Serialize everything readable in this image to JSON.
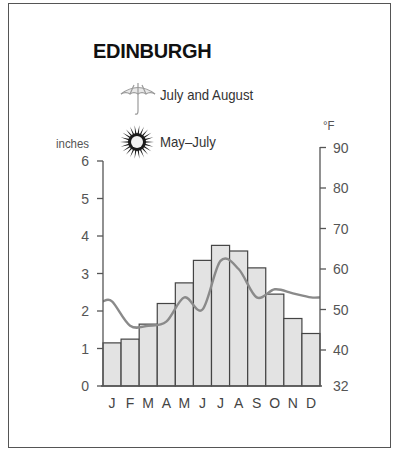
{
  "title": "EDINBURGH",
  "legend": {
    "rain": {
      "icon": "umbrella-icon",
      "label": "July and August"
    },
    "sun": {
      "icon": "sun-icon",
      "label": "May–July"
    }
  },
  "axes": {
    "left_label": "inches",
    "right_label": "°F",
    "left_ticks": [
      "0",
      "1",
      "2",
      "3",
      "4",
      "5",
      "6"
    ],
    "right_ticks": [
      "32",
      "40",
      "50",
      "60",
      "70",
      "80",
      "90"
    ]
  },
  "colors": {
    "bar_fill": "#e3e3e3",
    "bar_stroke": "#444444",
    "temp_line": "#8a8a8a",
    "axis": "#555555"
  },
  "chart_data": {
    "type": "bar",
    "title": "EDINBURGH",
    "categories": [
      "J",
      "F",
      "M",
      "A",
      "M",
      "J",
      "J",
      "A",
      "S",
      "O",
      "N",
      "D"
    ],
    "series": [
      {
        "name": "Rainfall (inches)",
        "type": "bar",
        "axis": "left",
        "values": [
          1.15,
          1.25,
          1.65,
          2.2,
          2.75,
          3.35,
          3.75,
          3.6,
          3.15,
          2.45,
          1.8,
          1.4
        ]
      },
      {
        "name": "Temperature (°F)",
        "type": "line",
        "axis": "right",
        "values": [
          52,
          46,
          46,
          47,
          53,
          50,
          62,
          60,
          53,
          55,
          54,
          53
        ]
      }
    ],
    "xlabel": "",
    "ylabel": "inches",
    "ylabel_right": "°F",
    "ylim": [
      0,
      6
    ],
    "ylim_right": [
      32,
      90
    ],
    "legend_entries": [
      "July and August (wettest)",
      "May–July (sunniest)"
    ],
    "grid": false
  }
}
